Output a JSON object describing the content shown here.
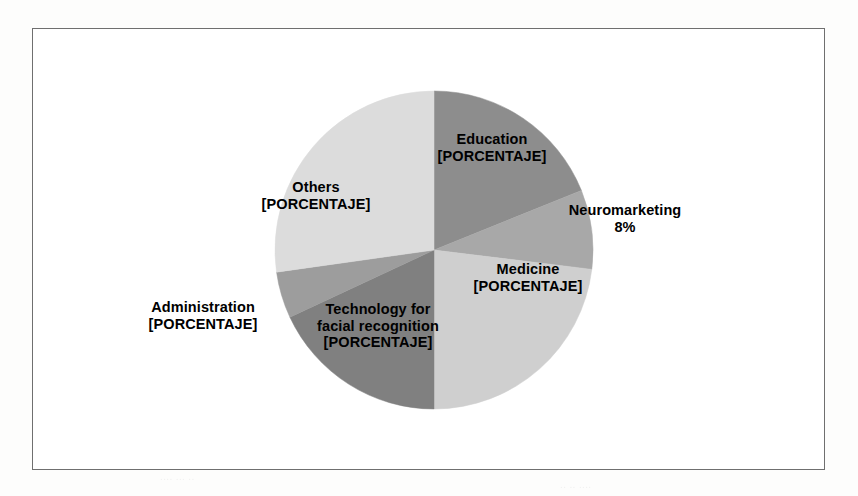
{
  "page": {
    "background_color": "#ffffff",
    "frame_border_color": "#6f6f6f"
  },
  "chart_data": {
    "type": "pie",
    "title": "",
    "subtitle": "",
    "xlabel": "",
    "ylabel": "",
    "legend_position": "none",
    "grid": false,
    "labels_inside": true,
    "start_angle_deg": 0,
    "direction": "clockwise",
    "categories": [
      "Education",
      "Neuromarketing",
      "Medicine",
      "Technology for facial recognition",
      "Administration",
      "Others"
    ],
    "values": [
      19,
      8,
      23,
      18,
      5,
      27
    ],
    "value_labels": [
      "[PORCENTAJE]",
      "8%",
      "[PORCENTAJE]",
      "[PORCENTAJE]",
      "[PORCENTAJE]",
      "[PORCENTAJE]"
    ],
    "colors": [
      "#8d8d8d",
      "#a8a8a8",
      "#cfcfcf",
      "#808080",
      "#9d9d9d",
      "#dcdcdc"
    ],
    "slices": [
      {
        "name": "Education",
        "value_label": "[PORCENTAJE]",
        "value": 19,
        "start_deg": 0,
        "end_deg": 68,
        "color": "#8d8d8d",
        "label_lines": [
          "Education",
          "[PORCENTAJE]",
          ""
        ]
      },
      {
        "name": "Neuromarketing",
        "value_label": "8%",
        "value": 8,
        "start_deg": 68,
        "end_deg": 97,
        "color": "#a8a8a8",
        "label_lines": [
          "Neuromarketing",
          "8%",
          ""
        ]
      },
      {
        "name": "Medicine",
        "value_label": "[PORCENTAJE]",
        "value": 23,
        "start_deg": 97,
        "end_deg": 180,
        "color": "#cfcfcf",
        "label_lines": [
          "Medicine",
          "[PORCENTAJE]",
          ""
        ]
      },
      {
        "name": "Technology for facial recognition",
        "value_label": "[PORCENTAJE]",
        "value": 18,
        "start_deg": 180,
        "end_deg": 245,
        "color": "#808080",
        "label_lines": [
          "Technology for",
          "facial recognition",
          "[PORCENTAJE]"
        ]
      },
      {
        "name": "Administration",
        "value_label": "[PORCENTAJE]",
        "value": 5,
        "start_deg": 245,
        "end_deg": 262,
        "color": "#9d9d9d",
        "label_lines": [
          "Administration",
          "[PORCENTAJE]",
          ""
        ]
      },
      {
        "name": "Others",
        "value_label": "[PORCENTAJE]",
        "value": 27,
        "start_deg": 262,
        "end_deg": 360,
        "color": "#dcdcdc",
        "label_lines": [
          "Others",
          "[PORCENTAJE]",
          ""
        ]
      }
    ],
    "geometry": {
      "center_x": 401,
      "center_y": 221,
      "radius": 159
    }
  }
}
